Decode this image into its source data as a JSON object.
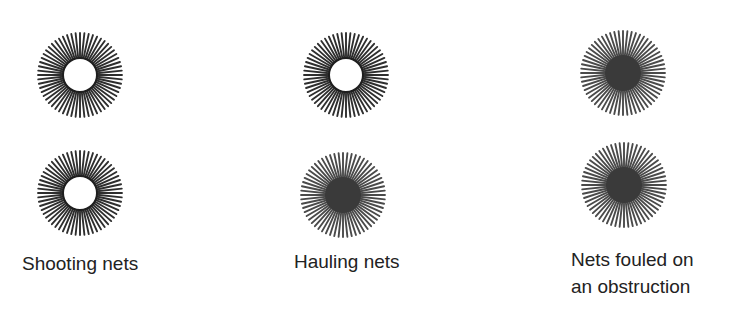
{
  "diagram": {
    "title": "",
    "colors": {
      "ray_white": "#2e2e2e",
      "ray_red": "#4a4a4a",
      "fill_red": "#3a3a3a",
      "fill_white": "#ffffff",
      "ring": "#1e1e1e"
    },
    "columns": [
      {
        "id": "shooting",
        "caption": "Shooting nets",
        "caption_lines": [
          "Shooting nets"
        ],
        "lights": [
          {
            "position": "top",
            "type": "white",
            "label": "white light"
          },
          {
            "position": "bottom",
            "type": "white",
            "label": "white light"
          }
        ]
      },
      {
        "id": "hauling",
        "caption": "Hauling nets",
        "caption_lines": [
          "Hauling nets"
        ],
        "lights": [
          {
            "position": "top",
            "type": "white",
            "label": "white light"
          },
          {
            "position": "bottom",
            "type": "red",
            "label": "red light"
          }
        ]
      },
      {
        "id": "fouled",
        "caption": "Nets fouled on an obstruction",
        "caption_lines": [
          "Nets fouled on",
          "an obstruction"
        ],
        "lights": [
          {
            "position": "top",
            "type": "red",
            "label": "red light"
          },
          {
            "position": "bottom",
            "type": "red",
            "label": "red light"
          }
        ]
      }
    ]
  }
}
